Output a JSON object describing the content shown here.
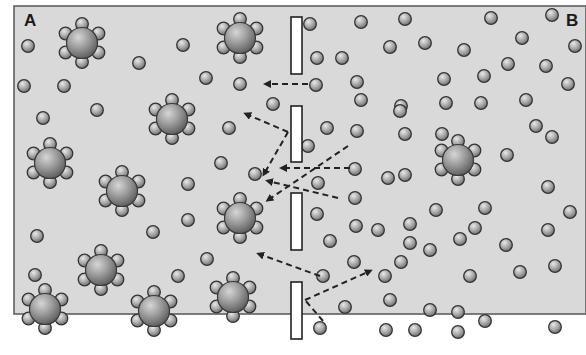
{
  "diagram": {
    "type": "osmosis-membrane",
    "labels": {
      "left": "A",
      "right": "B"
    },
    "colors": {
      "background": "#d9d9d9",
      "frame": "#555555",
      "membrane_fill": "#ffffff",
      "membrane_stroke": "#222222",
      "molecule_outline": "#333333",
      "arrow": "#222222"
    },
    "frame": {
      "x": 14,
      "y": 6,
      "w": 572,
      "h": 308
    },
    "membrane_segments": [
      {
        "x": 291,
        "y": 17,
        "w": 11,
        "h": 57
      },
      {
        "x": 291,
        "y": 106,
        "w": 11,
        "h": 56
      },
      {
        "x": 291,
        "y": 193,
        "w": 11,
        "h": 57
      },
      {
        "x": 291,
        "y": 282,
        "w": 11,
        "h": 57
      }
    ],
    "solute_clusters": [
      {
        "x": 82,
        "y": 43
      },
      {
        "x": 240,
        "y": 38
      },
      {
        "x": 172,
        "y": 119
      },
      {
        "x": 50,
        "y": 163
      },
      {
        "x": 122,
        "y": 191
      },
      {
        "x": 240,
        "y": 218
      },
      {
        "x": 101,
        "y": 270
      },
      {
        "x": 45,
        "y": 309
      },
      {
        "x": 154,
        "y": 311
      },
      {
        "x": 233,
        "y": 297
      },
      {
        "x": 458,
        "y": 160
      }
    ],
    "water_molecules": [
      [
        28,
        46
      ],
      [
        24,
        86
      ],
      [
        64,
        86
      ],
      [
        97,
        110
      ],
      [
        43,
        118
      ],
      [
        183,
        45
      ],
      [
        139,
        63
      ],
      [
        206,
        78
      ],
      [
        240,
        84
      ],
      [
        273,
        104
      ],
      [
        229,
        128
      ],
      [
        255,
        174
      ],
      [
        221,
        163
      ],
      [
        188,
        184
      ],
      [
        188,
        220
      ],
      [
        153,
        232
      ],
      [
        37,
        236
      ],
      [
        207,
        259
      ],
      [
        178,
        276
      ],
      [
        35,
        275
      ],
      [
        310,
        24
      ],
      [
        361,
        22
      ],
      [
        405,
        19
      ],
      [
        491,
        18
      ],
      [
        552,
        15
      ],
      [
        575,
        46
      ],
      [
        425,
        43
      ],
      [
        522,
        38
      ],
      [
        317,
        58
      ],
      [
        342,
        58
      ],
      [
        390,
        47
      ],
      [
        464,
        50
      ],
      [
        508,
        64
      ],
      [
        546,
        66
      ],
      [
        316,
        85
      ],
      [
        357,
        82
      ],
      [
        444,
        79
      ],
      [
        484,
        76
      ],
      [
        568,
        84
      ],
      [
        401,
        106
      ],
      [
        446,
        103
      ],
      [
        327,
        128
      ],
      [
        361,
        100
      ],
      [
        400,
        111
      ],
      [
        481,
        103
      ],
      [
        526,
        100
      ],
      [
        308,
        146
      ],
      [
        357,
        131
      ],
      [
        405,
        134
      ],
      [
        442,
        134
      ],
      [
        536,
        126
      ],
      [
        355,
        169
      ],
      [
        405,
        175
      ],
      [
        507,
        155
      ],
      [
        552,
        137
      ],
      [
        318,
        183
      ],
      [
        355,
        198
      ],
      [
        388,
        178
      ],
      [
        436,
        210
      ],
      [
        485,
        208
      ],
      [
        548,
        187
      ],
      [
        317,
        214
      ],
      [
        378,
        230
      ],
      [
        410,
        224
      ],
      [
        475,
        228
      ],
      [
        570,
        212
      ],
      [
        330,
        241
      ],
      [
        356,
        226
      ],
      [
        410,
        243
      ],
      [
        460,
        239
      ],
      [
        506,
        245
      ],
      [
        548,
        230
      ],
      [
        354,
        262
      ],
      [
        401,
        262
      ],
      [
        430,
        250
      ],
      [
        520,
        272
      ],
      [
        555,
        266
      ],
      [
        323,
        276
      ],
      [
        385,
        276
      ],
      [
        470,
        276
      ],
      [
        390,
        300
      ],
      [
        345,
        307
      ],
      [
        430,
        310
      ],
      [
        458,
        312
      ],
      [
        485,
        321
      ],
      [
        320,
        328
      ],
      [
        386,
        330
      ],
      [
        415,
        330
      ],
      [
        458,
        332
      ],
      [
        555,
        327
      ]
    ],
    "arrows": [
      {
        "from": [
          308,
          84
        ],
        "to": [
          266,
          84
        ]
      },
      {
        "from": [
          288,
          132
        ],
        "to": [
          246,
          114
        ]
      },
      {
        "from": [
          288,
          132
        ],
        "to": [
          264,
          174
        ]
      },
      {
        "from": [
          348,
          146
        ],
        "to": [
          268,
          200
        ]
      },
      {
        "from": [
          350,
          168
        ],
        "to": [
          282,
          168
        ]
      },
      {
        "from": [
          338,
          198
        ],
        "to": [
          268,
          181
        ]
      },
      {
        "from": [
          320,
          276
        ],
        "to": [
          259,
          254
        ]
      },
      {
        "from": [
          323,
          321
        ],
        "to": [
          305,
          300
        ]
      },
      {
        "from": [
          305,
          300
        ],
        "to": [
          370,
          271
        ]
      }
    ]
  }
}
